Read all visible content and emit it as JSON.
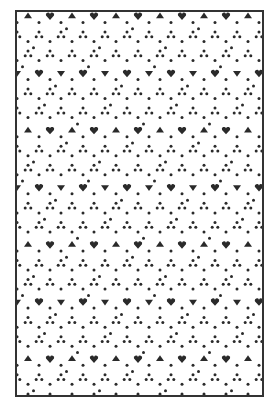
{
  "figure": {
    "frame": {
      "border_color": "#333333",
      "background": "#ffffff"
    },
    "pattern": {
      "ink_color": "#2a2a2a",
      "cell_size": 22,
      "dot_radius": 1.5,
      "triangle_size": 4,
      "heart_size": 4
    }
  }
}
